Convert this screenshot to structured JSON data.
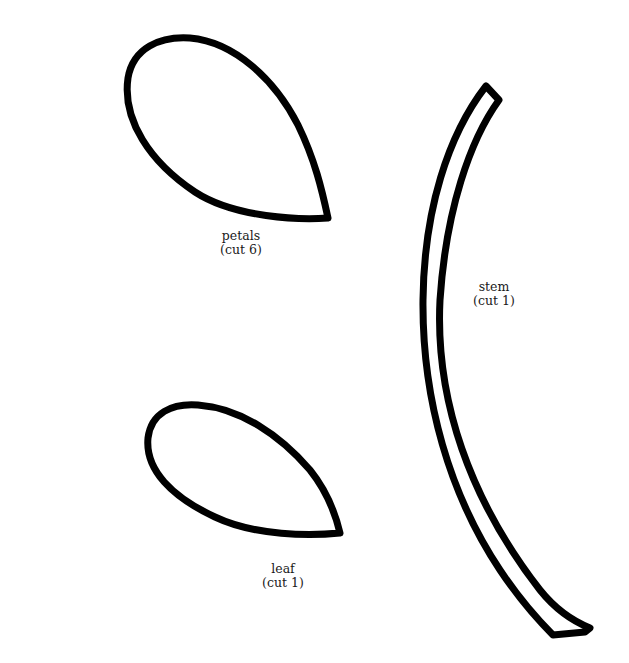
{
  "pieces": {
    "petals": {
      "name": "petals",
      "instruction": "(cut 6)"
    },
    "stem": {
      "name": "stem",
      "instruction": "(cut 1)"
    },
    "leaf": {
      "name": "leaf",
      "instruction": "(cut 1)"
    }
  },
  "colors": {
    "outline": "#000000",
    "background": "#ffffff",
    "text": "#1a1a1a"
  }
}
